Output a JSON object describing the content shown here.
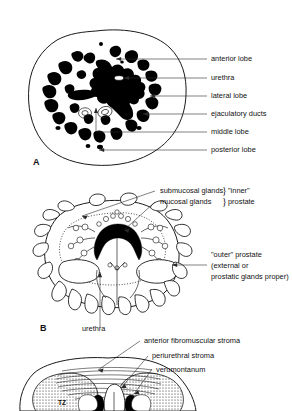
{
  "figure": {
    "background_color": "#ffffff",
    "ink_color": "#111111",
    "gland_fill_color": "#000000"
  },
  "panels": [
    {
      "id": "A",
      "letter": "A",
      "caption": "Lobar anatomy of the prostate (transverse section)",
      "labels": [
        {
          "key": "anterior_lobe",
          "text": "anterior lobe"
        },
        {
          "key": "urethra",
          "text": "urethra"
        },
        {
          "key": "lateral_lobe",
          "text": "lateral lobe"
        },
        {
          "key": "ejaculatory_ducts",
          "text": "ejaculatory ducts"
        },
        {
          "key": "middle_lobe",
          "text": "middle lobe"
        },
        {
          "key": "posterior_lobe",
          "text": "posterior lobe"
        }
      ]
    },
    {
      "id": "B",
      "letter": "B",
      "caption": "Inner and outer prostate glandular groups",
      "labels": [
        {
          "key": "submucosal_glands",
          "text": "submucosal glands"
        },
        {
          "key": "mucosal_glands",
          "text": "mucosal glands"
        },
        {
          "key": "inner_prostate_line1",
          "text": "\"inner\""
        },
        {
          "key": "inner_prostate_line2",
          "text": "prostate"
        },
        {
          "key": "outer_prostate_line1",
          "text": "\"outer\" prostate"
        },
        {
          "key": "outer_prostate_line2",
          "text": "(external or"
        },
        {
          "key": "outer_prostate_line3",
          "text": "prostatic glands proper)"
        },
        {
          "key": "urethra",
          "text": "urethra"
        }
      ],
      "braces": [
        "}",
        "}"
      ]
    },
    {
      "id": "C",
      "letter": "C",
      "caption": "Zonal anatomy of the prostate (partially cropped)",
      "labels": [
        {
          "key": "anterior_fibromuscular_stroma",
          "text": "anterior fibromuscular stroma"
        },
        {
          "key": "periurethral_stroma",
          "text": "periurethral stroma"
        },
        {
          "key": "verumontanum",
          "text": "verumontanum"
        },
        {
          "key": "transition_zone",
          "text": "TZ"
        }
      ]
    }
  ]
}
